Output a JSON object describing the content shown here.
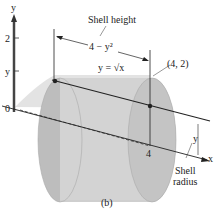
{
  "figure": {
    "panel_label": "(b)",
    "axes": {
      "y_axis_label": "y",
      "x_axis_label": "x",
      "origin_label": "0",
      "y_tick_2": "2",
      "y_tick_y": "y",
      "x_tick_4": "4"
    },
    "labels": {
      "shell_height": "Shell height",
      "height_expr": "4 − y²",
      "curve": "y = √x",
      "point": "(4, 2)",
      "radius_symbol": "y",
      "shell_radius_line1": "Shell",
      "shell_radius_line2": "radius"
    },
    "colors": {
      "shell_fill": "#c9c9c9",
      "shell_dark": "#9a9a9a",
      "line": "#222222",
      "y_axis_bar": "#555555"
    }
  }
}
